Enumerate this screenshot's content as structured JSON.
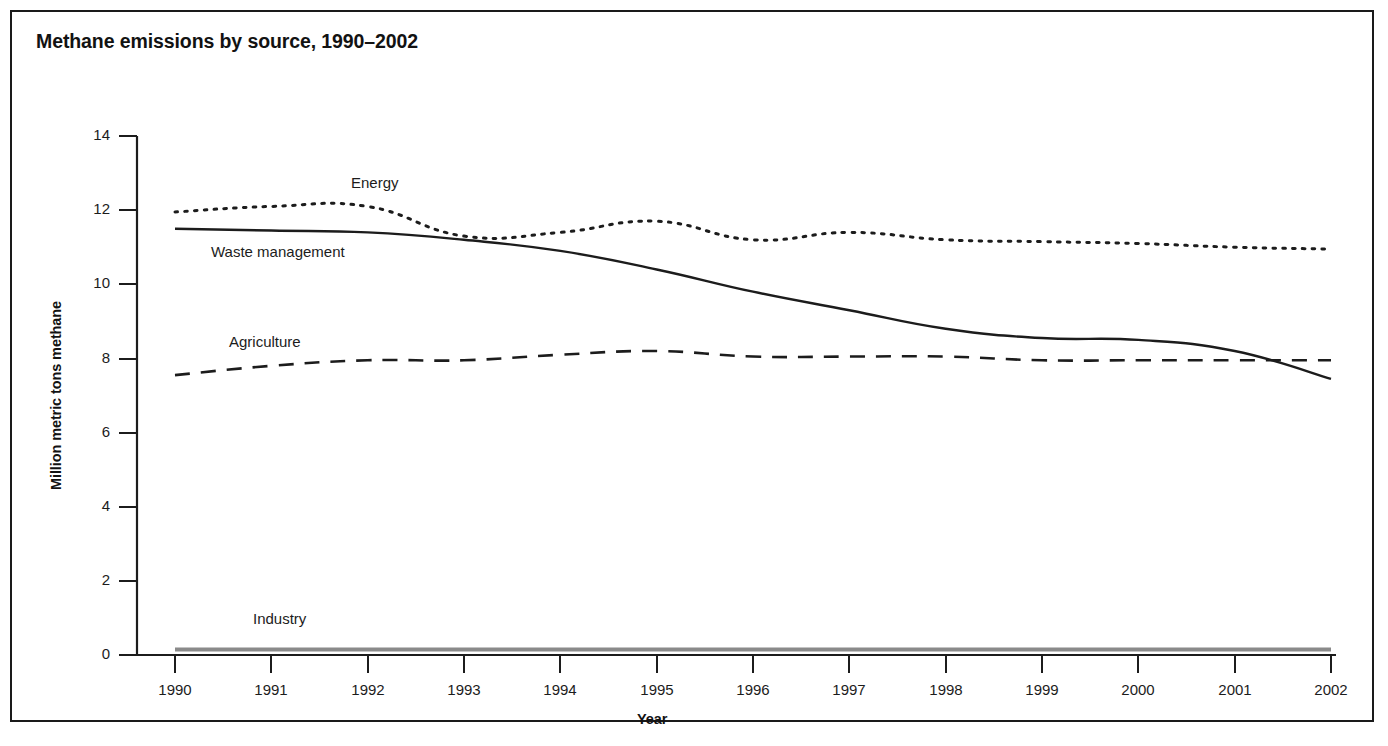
{
  "figure": {
    "title": "Methane emissions by source, 1990–2002"
  },
  "axes": {
    "x_title": "Year",
    "y_title": "Million metric tons methane",
    "y_ticks": [
      "0",
      "2",
      "4",
      "6",
      "8",
      "10",
      "12",
      "14"
    ],
    "x_ticks": [
      "1990",
      "1991",
      "1992",
      "1993",
      "1994",
      "1995",
      "1996",
      "1997",
      "1998",
      "1999",
      "2000",
      "2001",
      "2002"
    ]
  },
  "series_labels": {
    "energy": "Energy",
    "waste": "Waste management",
    "agriculture": "Agriculture",
    "industry": "Industry"
  },
  "colors": {
    "line": "#1c1c1c",
    "industry_line": "#8a8a8a",
    "frame": "#1a1a1a",
    "background": "#ffffff"
  },
  "chart_data": {
    "type": "line",
    "title": "Methane emissions by source, 1990–2002",
    "xlabel": "Year",
    "ylabel": "Million metric tons methane",
    "xlim": [
      1990,
      2002
    ],
    "ylim": [
      0,
      14
    ],
    "y_ticks": [
      0,
      2,
      4,
      6,
      8,
      10,
      12,
      14
    ],
    "grid": false,
    "legend": "inline-labels",
    "x": [
      1990,
      1991,
      1992,
      1993,
      1994,
      1995,
      1996,
      1997,
      1998,
      1999,
      2000,
      2001,
      2002
    ],
    "series": [
      {
        "name": "Energy",
        "style": "dotted",
        "values": [
          11.95,
          12.1,
          12.1,
          11.3,
          11.4,
          11.7,
          11.2,
          11.4,
          11.2,
          11.15,
          11.1,
          11.0,
          10.95
        ]
      },
      {
        "name": "Waste management",
        "style": "solid",
        "values": [
          11.5,
          11.45,
          11.4,
          11.2,
          10.9,
          10.4,
          9.8,
          9.3,
          8.8,
          8.55,
          8.5,
          8.2,
          7.45
        ]
      },
      {
        "name": "Agriculture",
        "style": "dashed",
        "values": [
          7.55,
          7.8,
          7.95,
          7.95,
          8.1,
          8.2,
          8.05,
          8.05,
          8.05,
          7.95,
          7.95,
          7.95,
          7.95
        ]
      },
      {
        "name": "Industry",
        "style": "solid-gray",
        "values": [
          0.15,
          0.15,
          0.15,
          0.15,
          0.15,
          0.15,
          0.15,
          0.15,
          0.15,
          0.15,
          0.15,
          0.15,
          0.15
        ]
      }
    ]
  }
}
